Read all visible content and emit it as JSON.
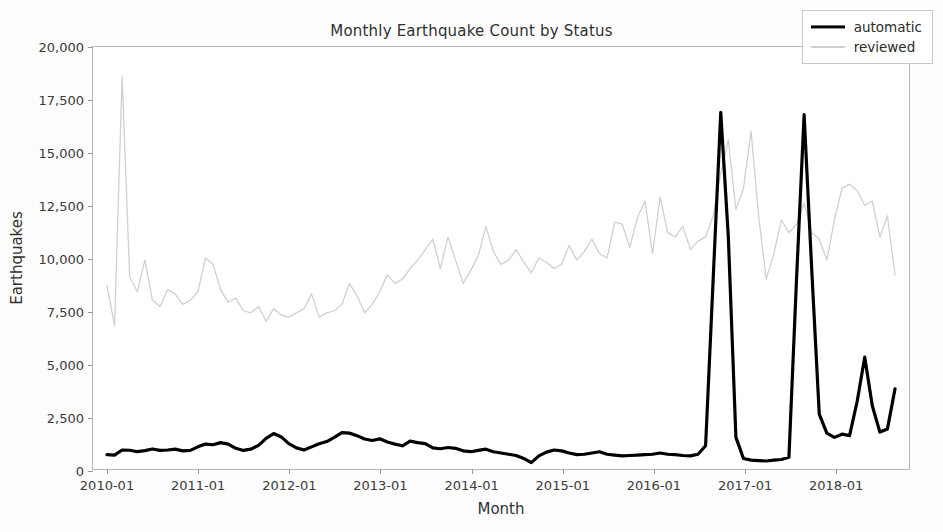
{
  "chart_data": {
    "type": "line",
    "title": "Monthly Earthquake Count by Status",
    "xlabel": "Month",
    "ylabel": "Earthquakes",
    "ylim": [
      0,
      20000
    ],
    "ytick_labels": [
      "0",
      "2,500",
      "5,000",
      "7,500",
      "10,000",
      "12,500",
      "15,000",
      "17,500",
      "20,000"
    ],
    "ytick_values": [
      0,
      2500,
      5000,
      7500,
      10000,
      12500,
      15000,
      17500,
      20000
    ],
    "xtick_labels": [
      "2010-01",
      "2011-01",
      "2012-01",
      "2013-01",
      "2014-01",
      "2015-01",
      "2016-01",
      "2017-01",
      "2018-01"
    ],
    "xtick_values": [
      "2010-01",
      "2011-01",
      "2012-01",
      "2013-01",
      "2014-01",
      "2015-01",
      "2016-01",
      "2017-01",
      "2018-01"
    ],
    "grid": false,
    "legend_position": "upper right",
    "colors": {
      "automatic": "#000000",
      "reviewed": "#d0d0d0"
    },
    "x": [
      "2010-01",
      "2010-02",
      "2010-03",
      "2010-04",
      "2010-05",
      "2010-06",
      "2010-07",
      "2010-08",
      "2010-09",
      "2010-10",
      "2010-11",
      "2010-12",
      "2011-01",
      "2011-02",
      "2011-03",
      "2011-04",
      "2011-05",
      "2011-06",
      "2011-07",
      "2011-08",
      "2011-09",
      "2011-10",
      "2011-11",
      "2011-12",
      "2012-01",
      "2012-02",
      "2012-03",
      "2012-04",
      "2012-05",
      "2012-06",
      "2012-07",
      "2012-08",
      "2012-09",
      "2012-10",
      "2012-11",
      "2012-12",
      "2013-01",
      "2013-02",
      "2013-03",
      "2013-04",
      "2013-05",
      "2013-06",
      "2013-07",
      "2013-08",
      "2013-09",
      "2013-10",
      "2013-11",
      "2013-12",
      "2014-01",
      "2014-02",
      "2014-03",
      "2014-04",
      "2014-05",
      "2014-06",
      "2014-07",
      "2014-08",
      "2014-09",
      "2014-10",
      "2014-11",
      "2014-12",
      "2015-01",
      "2015-02",
      "2015-03",
      "2015-04",
      "2015-05",
      "2015-06",
      "2015-07",
      "2015-08",
      "2015-09",
      "2015-10",
      "2015-11",
      "2015-12",
      "2016-01",
      "2016-02",
      "2016-03",
      "2016-04",
      "2016-05",
      "2016-06",
      "2016-07",
      "2016-08",
      "2016-09",
      "2016-10",
      "2016-11",
      "2016-12",
      "2017-01",
      "2017-02",
      "2017-03",
      "2017-04",
      "2017-05",
      "2017-06",
      "2017-07",
      "2017-08",
      "2017-09",
      "2017-10",
      "2017-11",
      "2017-12",
      "2018-01",
      "2018-02",
      "2018-03",
      "2018-04",
      "2018-05",
      "2018-06",
      "2018-07",
      "2018-08",
      "2018-09"
    ],
    "series": [
      {
        "name": "automatic",
        "color": "#000000",
        "linewidth": 3.2,
        "values": [
          680,
          660,
          900,
          890,
          820,
          870,
          950,
          880,
          900,
          940,
          860,
          880,
          1050,
          1180,
          1150,
          1250,
          1180,
          980,
          880,
          940,
          1120,
          1450,
          1680,
          1520,
          1200,
          1000,
          900,
          1050,
          1200,
          1300,
          1500,
          1720,
          1700,
          1580,
          1420,
          1350,
          1430,
          1280,
          1180,
          1100,
          1320,
          1250,
          1200,
          1000,
          960,
          1020,
          980,
          860,
          820,
          880,
          940,
          820,
          760,
          700,
          640,
          500,
          300,
          620,
          800,
          900,
          860,
          760,
          680,
          700,
          760,
          820,
          700,
          660,
          620,
          640,
          660,
          680,
          700,
          760,
          700,
          680,
          640,
          620,
          700,
          1100,
          9000,
          16900,
          11000,
          1500,
          500,
          420,
          400,
          380,
          420,
          450,
          560,
          9000,
          16800,
          9500,
          2600,
          1700,
          1500,
          1650,
          1580,
          3200,
          5300,
          3000,
          1750,
          1900,
          3800
        ]
      },
      {
        "name": "reviewed",
        "color": "#d0d0d0",
        "linewidth": 1.3,
        "values": [
          8700,
          6800,
          18600,
          9100,
          8400,
          9900,
          8000,
          7700,
          8500,
          8300,
          7800,
          8000,
          8400,
          10000,
          9700,
          8500,
          7900,
          8100,
          7500,
          7400,
          7700,
          7000,
          7600,
          7300,
          7200,
          7400,
          7600,
          8300,
          7200,
          7400,
          7500,
          7800,
          8800,
          8200,
          7400,
          7800,
          8400,
          9200,
          8800,
          9000,
          9500,
          9900,
          10400,
          10900,
          9500,
          11000,
          9900,
          8800,
          9400,
          10100,
          11500,
          10300,
          9700,
          9900,
          10400,
          9800,
          9300,
          10000,
          9800,
          9500,
          9700,
          10600,
          9900,
          10300,
          10900,
          10200,
          10000,
          11700,
          11600,
          10500,
          11900,
          12700,
          10200,
          12900,
          11200,
          11000,
          11500,
          10400,
          10800,
          11000,
          12000,
          14000,
          15600,
          12300,
          13300,
          16000,
          12000,
          9000,
          10200,
          11800,
          11200,
          11600,
          12600,
          11200,
          10900,
          9900,
          11800,
          13300,
          13500,
          13200,
          12500,
          12700,
          11000,
          12000,
          9200
        ]
      }
    ]
  },
  "legend": {
    "items": [
      {
        "label": "automatic"
      },
      {
        "label": "reviewed"
      }
    ]
  }
}
